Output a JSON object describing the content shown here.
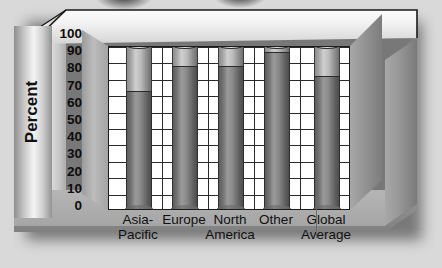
{
  "chart_data": {
    "type": "bar",
    "title": "",
    "subtitle": "",
    "xlabel": "",
    "ylabel": "Percent",
    "ylim": [
      0,
      100
    ],
    "yticks": [
      0,
      10,
      20,
      30,
      40,
      50,
      60,
      70,
      80,
      90,
      100
    ],
    "grid": true,
    "legend": "none",
    "categories": [
      "Asia-Pacific",
      "Europe",
      "North America",
      "Other",
      "Global Average"
    ],
    "category_lines": [
      [
        "Asia-",
        "Pacific"
      ],
      [
        "Europe",
        ""
      ],
      [
        "North",
        "America"
      ],
      [
        "Other",
        ""
      ],
      [
        "Global",
        "Average"
      ]
    ],
    "series": [
      {
        "name": "Filled",
        "values": [
          72,
          87,
          87,
          96,
          81
        ]
      },
      {
        "name": "Capacity",
        "values": [
          100,
          100,
          100,
          100,
          100
        ]
      }
    ],
    "values": [
      72,
      87,
      87,
      96,
      81
    ],
    "note": "Each cylinder is drawn to 100; the darker lower segment marks the value."
  },
  "axis": {
    "title": "Percent",
    "ticks": [
      "100",
      "90",
      "80",
      "70",
      "60",
      "50",
      "40",
      "30",
      "20",
      "10",
      "0"
    ]
  },
  "colors": {
    "background": "#d9d9d9",
    "plot_background": "#ffffff",
    "gridline": "#2a2a2a",
    "bar_fill_dark": "#7b7b7b",
    "bar_empty_light": "#c4c4c4",
    "frame": "#a8a8a8",
    "text": "#101010"
  }
}
